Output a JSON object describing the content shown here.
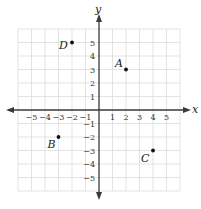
{
  "diagram": {
    "type": "coordinate-plane",
    "axes": {
      "x_label": "x",
      "y_label": "y",
      "x_range": [
        -6,
        6
      ],
      "y_range": [
        -6,
        6
      ],
      "x_ticks": [
        "−5",
        "−4",
        "−3",
        "−2",
        "−1",
        "1",
        "2",
        "3",
        "4",
        "5"
      ],
      "y_ticks": [
        "5",
        "4",
        "3",
        "2",
        "1",
        "−1",
        "−2",
        "−3",
        "−4",
        "−5"
      ]
    },
    "points": [
      {
        "label": "A",
        "x": 2,
        "y": 3
      },
      {
        "label": "B",
        "x": -3,
        "y": -2
      },
      {
        "label": "C",
        "x": 4,
        "y": -3
      },
      {
        "label": "D",
        "x": -2,
        "y": 5
      }
    ],
    "colors": {
      "grid": "#dcdcdc",
      "axis": "#3a3a3a",
      "point": "#111111"
    }
  }
}
